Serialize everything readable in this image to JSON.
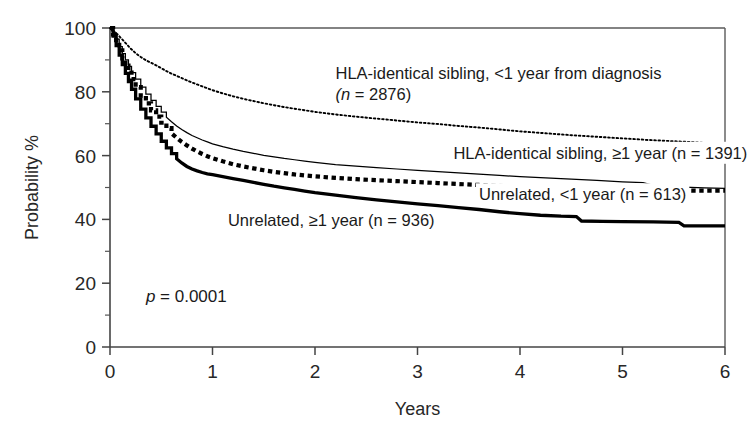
{
  "chart_data": {
    "type": "line",
    "title": "",
    "subtitle": "",
    "xlabel": "Years",
    "ylabel": "Probability %",
    "xlim": [
      0,
      6
    ],
    "ylim": [
      0,
      100
    ],
    "grid": false,
    "legend_position": "inline-annotations",
    "x_ticks": [
      "0",
      "1",
      "2",
      "3",
      "4",
      "5",
      "6"
    ],
    "x_tick_values": [
      0,
      1,
      2,
      3,
      4,
      5,
      6
    ],
    "y_ticks": [
      "0",
      "20",
      "40",
      "60",
      "80",
      "100"
    ],
    "y_tick_values": [
      0,
      20,
      40,
      60,
      80,
      100
    ],
    "y_minor_tick_values": [
      10,
      30,
      50,
      70,
      90
    ],
    "annotations": [
      {
        "name": "p-value",
        "text_prefix": "p",
        "text_rest": " = 0.0001",
        "x": 0.35,
        "y": 14
      }
    ],
    "series": [
      {
        "name": "HLA-identical sibling, <1 year from diagnosis (n = 2876)",
        "label_line1": "HLA-identical sibling, <1 year from diagnosis",
        "label_line2_prefix": "(n",
        "label_line2_rest": " = 2876)",
        "style": "fine-dotted",
        "n": 2876,
        "label_x": 2.2,
        "label_y": 84,
        "points": [
          [
            0.0,
            100.0
          ],
          [
            0.04,
            99.0
          ],
          [
            0.08,
            97.8
          ],
          [
            0.12,
            96.4
          ],
          [
            0.16,
            95.0
          ],
          [
            0.2,
            93.6
          ],
          [
            0.25,
            92.1
          ],
          [
            0.3,
            90.9
          ],
          [
            0.35,
            89.9
          ],
          [
            0.4,
            89.1
          ],
          [
            0.45,
            88.3
          ],
          [
            0.5,
            87.4
          ],
          [
            0.55,
            86.5
          ],
          [
            0.6,
            85.7
          ],
          [
            0.65,
            85.0
          ],
          [
            0.7,
            84.3
          ],
          [
            0.75,
            83.6
          ],
          [
            0.8,
            82.9
          ],
          [
            0.85,
            82.3
          ],
          [
            0.9,
            81.7
          ],
          [
            0.95,
            81.1
          ],
          [
            1.0,
            80.5
          ],
          [
            1.1,
            79.5
          ],
          [
            1.2,
            78.6
          ],
          [
            1.3,
            77.8
          ],
          [
            1.4,
            77.1
          ],
          [
            1.5,
            76.4
          ],
          [
            1.6,
            75.8
          ],
          [
            1.7,
            75.2
          ],
          [
            1.8,
            74.7
          ],
          [
            1.9,
            74.2
          ],
          [
            2.0,
            73.7
          ],
          [
            2.2,
            72.9
          ],
          [
            2.4,
            72.2
          ],
          [
            2.6,
            71.6
          ],
          [
            2.8,
            71.0
          ],
          [
            3.0,
            70.4
          ],
          [
            3.2,
            69.9
          ],
          [
            3.4,
            69.3
          ],
          [
            3.6,
            68.8
          ],
          [
            3.8,
            68.2
          ],
          [
            4.0,
            67.6
          ],
          [
            4.25,
            67.0
          ],
          [
            4.5,
            66.4
          ],
          [
            4.75,
            65.9
          ],
          [
            5.0,
            65.4
          ],
          [
            5.25,
            64.9
          ],
          [
            5.5,
            64.5
          ],
          [
            5.75,
            64.1
          ],
          [
            6.0,
            63.6
          ]
        ]
      },
      {
        "name": "HLA-identical sibling, ≥1 year (n = 1391)",
        "label_line1_prefix": "HLA-identical sibling, ≥1 year (n",
        "label_line1_rest": " = 1391)",
        "style": "thin-solid",
        "n": 1391,
        "label_x": 3.35,
        "label_y": 59,
        "points": [
          [
            0.0,
            100.0
          ],
          [
            0.03,
            98.5
          ],
          [
            0.06,
            96.5
          ],
          [
            0.09,
            94.2
          ],
          [
            0.12,
            92.0
          ],
          [
            0.15,
            90.0
          ],
          [
            0.18,
            88.0
          ],
          [
            0.21,
            86.0
          ],
          [
            0.25,
            84.0
          ],
          [
            0.3,
            81.5
          ],
          [
            0.35,
            79.3
          ],
          [
            0.4,
            77.3
          ],
          [
            0.45,
            75.4
          ],
          [
            0.5,
            73.6
          ],
          [
            0.55,
            72.0
          ],
          [
            0.6,
            70.6
          ],
          [
            0.65,
            69.3
          ],
          [
            0.7,
            68.2
          ],
          [
            0.75,
            67.2
          ],
          [
            0.8,
            66.3
          ],
          [
            0.85,
            65.6
          ],
          [
            0.9,
            64.9
          ],
          [
            0.95,
            64.3
          ],
          [
            1.0,
            63.7
          ],
          [
            1.1,
            62.8
          ],
          [
            1.2,
            62.0
          ],
          [
            1.3,
            61.3
          ],
          [
            1.4,
            60.7
          ],
          [
            1.5,
            60.1
          ],
          [
            1.6,
            59.6
          ],
          [
            1.7,
            59.1
          ],
          [
            1.8,
            58.7
          ],
          [
            1.9,
            58.3
          ],
          [
            2.0,
            57.9
          ],
          [
            2.2,
            57.2
          ],
          [
            2.4,
            56.7
          ],
          [
            2.6,
            56.2
          ],
          [
            2.8,
            55.8
          ],
          [
            3.0,
            55.4
          ],
          [
            3.2,
            55.0
          ],
          [
            3.4,
            54.6
          ],
          [
            3.6,
            54.2
          ],
          [
            3.8,
            53.8
          ],
          [
            4.0,
            53.4
          ],
          [
            4.25,
            53.0
          ],
          [
            4.5,
            52.6
          ],
          [
            4.75,
            52.2
          ],
          [
            5.0,
            51.8
          ],
          [
            5.2,
            51.5
          ],
          [
            5.35,
            50.3
          ],
          [
            5.6,
            50.1
          ],
          [
            5.8,
            49.9
          ],
          [
            6.0,
            49.7
          ]
        ]
      },
      {
        "name": "Unrelated, <1 year (n = 613)",
        "label_line1_prefix": "Unrelated, <1 year (n",
        "label_line1_rest": " = 613)",
        "style": "thick-dotted",
        "n": 613,
        "label_x": 3.6,
        "label_y": 46,
        "points": [
          [
            0.0,
            100.0
          ],
          [
            0.03,
            98.0
          ],
          [
            0.06,
            95.5
          ],
          [
            0.09,
            93.0
          ],
          [
            0.12,
            90.5
          ],
          [
            0.15,
            88.2
          ],
          [
            0.18,
            86.0
          ],
          [
            0.21,
            84.0
          ],
          [
            0.25,
            81.5
          ],
          [
            0.3,
            78.8
          ],
          [
            0.35,
            76.4
          ],
          [
            0.4,
            74.2
          ],
          [
            0.45,
            72.2
          ],
          [
            0.5,
            70.3
          ],
          [
            0.55,
            68.6
          ],
          [
            0.6,
            67.0
          ],
          [
            0.65,
            65.6
          ],
          [
            0.7,
            64.3
          ],
          [
            0.75,
            63.2
          ],
          [
            0.8,
            62.2
          ],
          [
            0.85,
            61.3
          ],
          [
            0.9,
            60.5
          ],
          [
            0.95,
            59.8
          ],
          [
            1.0,
            59.2
          ],
          [
            1.1,
            58.2
          ],
          [
            1.2,
            57.3
          ],
          [
            1.3,
            56.6
          ],
          [
            1.4,
            56.0
          ],
          [
            1.5,
            55.4
          ],
          [
            1.6,
            54.9
          ],
          [
            1.7,
            54.5
          ],
          [
            1.8,
            54.1
          ],
          [
            1.9,
            53.8
          ],
          [
            2.0,
            53.5
          ],
          [
            2.2,
            53.0
          ],
          [
            2.4,
            52.6
          ],
          [
            2.6,
            52.3
          ],
          [
            2.8,
            52.0
          ],
          [
            3.0,
            51.7
          ],
          [
            3.2,
            51.4
          ],
          [
            3.4,
            51.1
          ],
          [
            3.6,
            50.8
          ],
          [
            3.8,
            50.5
          ],
          [
            4.0,
            50.2
          ],
          [
            4.25,
            50.0
          ],
          [
            4.5,
            49.8
          ],
          [
            4.75,
            49.6
          ],
          [
            5.0,
            49.4
          ],
          [
            5.25,
            49.2
          ],
          [
            5.5,
            49.1
          ],
          [
            5.75,
            49.0
          ],
          [
            6.0,
            49.0
          ]
        ]
      },
      {
        "name": "Unrelated, ≥1 year (n = 936)",
        "label_line1_prefix": "Unrelated, ≥1 year (n",
        "label_line1_rest": " = 936)",
        "style": "thick-solid",
        "n": 936,
        "label_x": 1.15,
        "label_y": 38,
        "points": [
          [
            0.0,
            100.0
          ],
          [
            0.03,
            97.5
          ],
          [
            0.06,
            94.5
          ],
          [
            0.09,
            91.5
          ],
          [
            0.12,
            88.5
          ],
          [
            0.15,
            85.8
          ],
          [
            0.18,
            83.2
          ],
          [
            0.21,
            80.8
          ],
          [
            0.25,
            77.8
          ],
          [
            0.3,
            74.6
          ],
          [
            0.35,
            71.8
          ],
          [
            0.4,
            69.2
          ],
          [
            0.45,
            66.8
          ],
          [
            0.5,
            64.5
          ],
          [
            0.55,
            62.4
          ],
          [
            0.6,
            60.6
          ],
          [
            0.65,
            59.0
          ],
          [
            0.7,
            57.7
          ],
          [
            0.75,
            56.6
          ],
          [
            0.8,
            55.8
          ],
          [
            0.85,
            55.2
          ],
          [
            0.9,
            54.7
          ],
          [
            0.95,
            54.3
          ],
          [
            1.0,
            54.0
          ],
          [
            1.1,
            53.4
          ],
          [
            1.2,
            52.8
          ],
          [
            1.3,
            52.2
          ],
          [
            1.4,
            51.6
          ],
          [
            1.5,
            51.0
          ],
          [
            1.6,
            50.4
          ],
          [
            1.7,
            49.9
          ],
          [
            1.8,
            49.4
          ],
          [
            1.9,
            48.9
          ],
          [
            2.0,
            48.4
          ],
          [
            2.2,
            47.6
          ],
          [
            2.4,
            46.8
          ],
          [
            2.6,
            46.1
          ],
          [
            2.8,
            45.5
          ],
          [
            3.0,
            44.9
          ],
          [
            3.2,
            44.3
          ],
          [
            3.4,
            43.7
          ],
          [
            3.6,
            43.1
          ],
          [
            3.8,
            42.4
          ],
          [
            4.0,
            41.8
          ],
          [
            4.2,
            41.3
          ],
          [
            4.4,
            41.0
          ],
          [
            4.55,
            40.9
          ],
          [
            4.6,
            39.5
          ],
          [
            4.8,
            39.4
          ],
          [
            5.0,
            39.3
          ],
          [
            5.3,
            39.2
          ],
          [
            5.55,
            39.1
          ],
          [
            5.6,
            38.0
          ],
          [
            5.8,
            38.0
          ],
          [
            6.0,
            38.0
          ]
        ]
      }
    ]
  },
  "plot_geometry": {
    "left": 110,
    "right": 725,
    "top": 28,
    "bottom": 347
  }
}
